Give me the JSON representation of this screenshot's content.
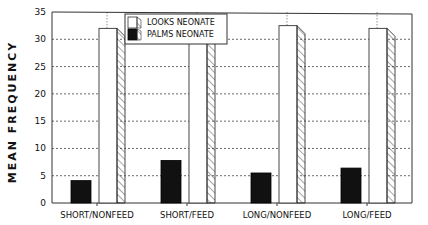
{
  "chart_data": {
    "type": "bar",
    "title": "",
    "xlabel": "",
    "ylabel": "MEAN FREQUENCY",
    "ylim": [
      0,
      35
    ],
    "yticks": [
      0,
      5,
      10,
      15,
      20,
      25,
      30,
      35
    ],
    "grid": true,
    "legend_position": "top-center",
    "categories": [
      "SHORT/NONFEED",
      "SHORT/FEED",
      "LONG/NONFEED",
      "LONG/FEED"
    ],
    "series": [
      {
        "name": "PALMS NEONATE",
        "fill": "#111111",
        "values": [
          4.1,
          7.8,
          5.5,
          6.4
        ]
      },
      {
        "name": "LOOKS NEONATE",
        "fill": "#ffffff",
        "values": [
          32.0,
          32.0,
          32.5,
          32.0
        ]
      }
    ]
  }
}
